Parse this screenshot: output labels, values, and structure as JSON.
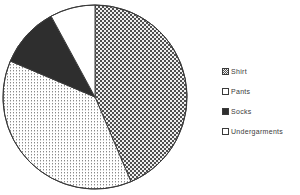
{
  "chart_data": {
    "type": "pie",
    "title": "",
    "subtitle": "",
    "xlabel": "",
    "ylabel": "",
    "grid": false,
    "legend_position": "right",
    "start_angle_deg": 0,
    "direction": "clockwise",
    "categories": [
      "Shirt",
      "Pants",
      "Socks",
      "Undergarments"
    ],
    "values": [
      43.6,
      37.8,
      10.7,
      7.9
    ],
    "units": "percent",
    "slice_angles_deg": [
      157.0,
      136.0,
      38.5,
      28.5
    ],
    "slice_patterns": [
      "checkerboard",
      "fine-dots",
      "solid-dark",
      "white"
    ],
    "annotations": []
  },
  "legend": {
    "items": [
      {
        "label": "Shirt",
        "swatch": "checkerboard-swatch"
      },
      {
        "label": "Pants",
        "swatch": "fine-dots-swatch"
      },
      {
        "label": "Socks",
        "swatch": "solid-dark-swatch"
      },
      {
        "label": "Undergarments",
        "swatch": "white-swatch"
      }
    ]
  },
  "colors": {
    "outline": "#3a3a3a",
    "solid_dark": "#2e2e2e",
    "pattern_dark": "#555555",
    "background": "#ffffff",
    "text": "#3a3a3a"
  }
}
